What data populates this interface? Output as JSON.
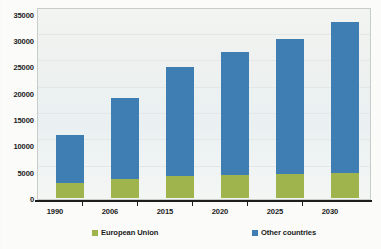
{
  "chart_data": {
    "type": "bar",
    "subtype": "stacked-bar",
    "title": "",
    "xlabel": "",
    "ylabel": "",
    "categories": [
      "1990",
      "2006",
      "2015",
      "2020",
      "2025",
      "2030"
    ],
    "series": [
      {
        "name": "European Union",
        "color": "#9fb44c",
        "values": [
          2900,
          3600,
          4200,
          4400,
          4600,
          4800
        ]
      },
      {
        "name": "Other countries",
        "color": "#3e7eb2",
        "values": [
          9100,
          15600,
          20800,
          23600,
          25900,
          28900
        ]
      }
    ],
    "totals": [
      12000,
      19200,
      25000,
      28000,
      30500,
      33700
    ],
    "ylim": [
      0,
      35000
    ],
    "yticks": [
      0,
      5000,
      10000,
      15000,
      20000,
      25000,
      30000,
      35000
    ],
    "ytick_labels": [
      "0",
      "5000",
      "10000",
      "15000",
      "20000",
      "25000",
      "30000",
      "35000"
    ],
    "grid": true,
    "legend_position": "bottom",
    "legend": [
      "European Union",
      "Other countries"
    ]
  },
  "axes": {
    "y_ticks": [
      {
        "label": "35000",
        "value": 35000
      },
      {
        "label": "30000",
        "value": 30000
      },
      {
        "label": "25000",
        "value": 25000
      },
      {
        "label": "20000",
        "value": 20000
      },
      {
        "label": "15000",
        "value": 15000
      },
      {
        "label": "10000",
        "value": 10000
      },
      {
        "label": "5000",
        "value": 5000
      },
      {
        "label": "0",
        "value": 0
      }
    ],
    "x_ticks": [
      {
        "label": "1990"
      },
      {
        "label": "2006"
      },
      {
        "label": "2015"
      },
      {
        "label": "2020"
      },
      {
        "label": "2025"
      },
      {
        "label": "2030"
      }
    ]
  },
  "legend": {
    "entries": [
      {
        "label": "European Union",
        "color": "#9fb44c"
      },
      {
        "label": "Other countries",
        "color": "#3e7eb2"
      }
    ]
  }
}
